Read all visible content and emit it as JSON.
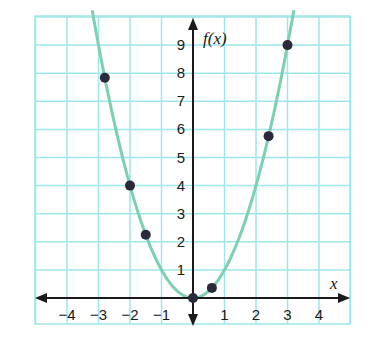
{
  "chart_data": {
    "type": "line",
    "title": "",
    "function": "f(x) = x^2",
    "xlabel": "x",
    "ylabel": "f(x)",
    "xlim": [
      -5,
      5
    ],
    "ylim": [
      -1,
      10
    ],
    "grid": true,
    "x_ticks": [
      -4,
      -3,
      -2,
      -1,
      1,
      2,
      3,
      4
    ],
    "x_tick_labels": [
      "−4",
      "−3",
      "−2",
      "−1",
      "1",
      "2",
      "3",
      "4"
    ],
    "y_ticks": [
      1,
      2,
      3,
      4,
      5,
      6,
      7,
      8,
      9
    ],
    "y_tick_labels": [
      "1",
      "2",
      "3",
      "4",
      "5",
      "6",
      "7",
      "8",
      "9"
    ],
    "series": [
      {
        "name": "curve",
        "kind": "line",
        "expression": "x^2",
        "x_range": [
          -3.2,
          3.2
        ]
      },
      {
        "name": "points",
        "kind": "scatter",
        "x": [
          -2.8,
          -2,
          -1.5,
          0,
          0.6,
          2.4,
          3
        ],
        "y": [
          7.84,
          4,
          2.25,
          0,
          0.36,
          5.76,
          9
        ]
      }
    ],
    "colors": {
      "grid": "#9fe6ea",
      "curve": "#7ccfb0",
      "points": "#2a2a3a",
      "axes": "#1a1a1a"
    }
  }
}
